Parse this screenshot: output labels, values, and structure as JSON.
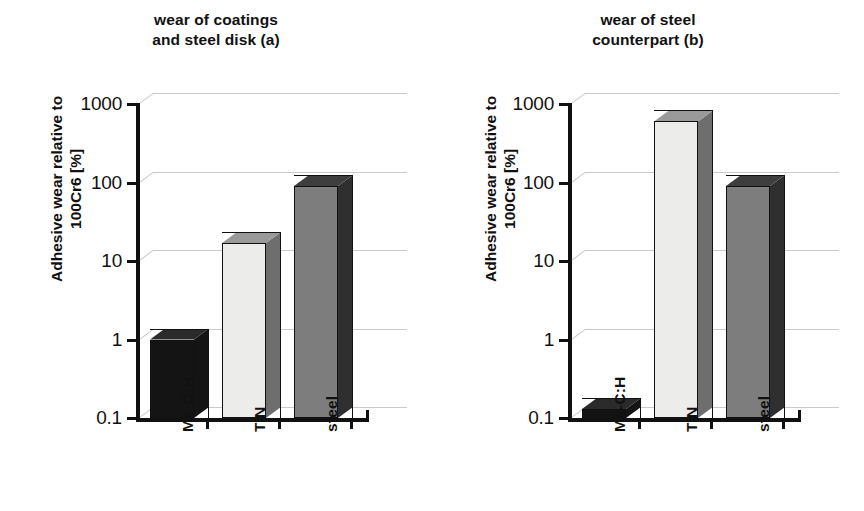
{
  "figure": {
    "y_axis_label_lines": [
      "Adhesive wear relative to",
      "100Cr6 [%]"
    ],
    "y_ticks": [
      "1000",
      "100",
      "10",
      "1",
      "0.1"
    ]
  },
  "panels": [
    {
      "id": "a",
      "title_lines": [
        "wear of coatings",
        "and steel disk (a)"
      ],
      "categories": [
        "Me-C:H",
        "TiN",
        "steel"
      ],
      "values": [
        1.0,
        17,
        90
      ],
      "styles": [
        "dark",
        "light",
        "mid"
      ]
    },
    {
      "id": "b",
      "title_lines": [
        "wear of steel",
        "counterpart (b)"
      ],
      "categories": [
        "Me-C:H",
        "TiN",
        "steel"
      ],
      "values": [
        0.13,
        600,
        90
      ],
      "styles": [
        "dark",
        "light",
        "mid"
      ]
    }
  ],
  "chart_data": [
    {
      "type": "bar",
      "title": "wear of coatings and steel disk (a)",
      "categories": [
        "Me-C:H",
        "TiN",
        "steel"
      ],
      "values": [
        1.0,
        17,
        90
      ],
      "xlabel": "",
      "ylabel": "Adhesive wear relative to 100Cr6 [%]",
      "yscale": "log",
      "ylim": [
        0.1,
        1000
      ],
      "ytick_labels": [
        "0.1",
        "1",
        "10",
        "100",
        "1000"
      ],
      "grid": true,
      "legend": "none",
      "style": "3d-bars",
      "bar_shading": [
        "dark",
        "light",
        "mid"
      ]
    },
    {
      "type": "bar",
      "title": "wear of steel counterpart (b)",
      "categories": [
        "Me-C:H",
        "TiN",
        "steel"
      ],
      "values": [
        0.13,
        600,
        90
      ],
      "xlabel": "",
      "ylabel": "Adhesive wear relative to 100Cr6 [%]",
      "yscale": "log",
      "ylim": [
        0.1,
        1000
      ],
      "ytick_labels": [
        "0.1",
        "1",
        "10",
        "100",
        "1000"
      ],
      "grid": true,
      "legend": "none",
      "style": "3d-bars",
      "bar_shading": [
        "dark",
        "light",
        "mid"
      ]
    }
  ]
}
